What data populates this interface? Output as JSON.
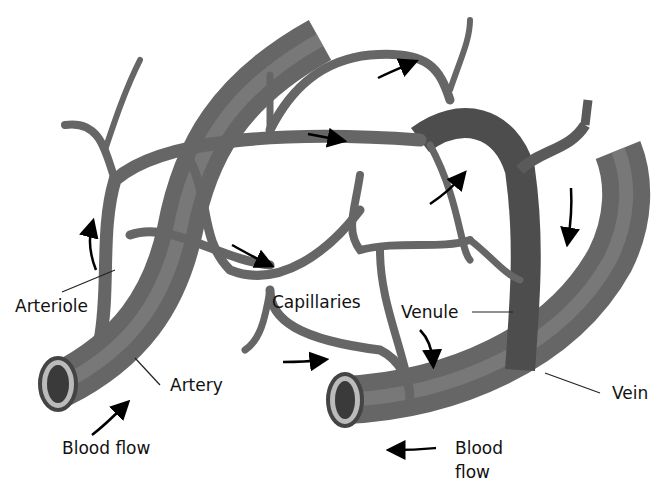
{
  "diagram": {
    "colors": {
      "background": "#ffffff",
      "vessel_dark": "#4a4a4a",
      "vessel_mid": "#7a7a7a",
      "vessel_light": "#a8a8a8",
      "text": "#111111",
      "arrow": "#000000"
    },
    "labels": {
      "arteriole": "Arteriole",
      "artery": "Artery",
      "blood_flow_left": "Blood flow",
      "capillaries": "Capillaries",
      "venule": "Venule",
      "vein": "Vein",
      "blood_flow_right_line1": "Blood",
      "blood_flow_right_line2": "flow"
    },
    "arrows": [
      {
        "id": "arrow-flow-in",
        "direction": "up-right"
      },
      {
        "id": "arrow-arteriole-up",
        "direction": "up"
      },
      {
        "id": "arrow-top-right",
        "direction": "right"
      },
      {
        "id": "arrow-mid-right",
        "direction": "right"
      },
      {
        "id": "arrow-capillary-right",
        "direction": "down-right"
      },
      {
        "id": "arrow-capillary-up",
        "direction": "up-right"
      },
      {
        "id": "arrow-vein-down",
        "direction": "down"
      },
      {
        "id": "arrow-bottom-right",
        "direction": "right"
      },
      {
        "id": "arrow-venule-down",
        "direction": "down"
      },
      {
        "id": "arrow-flow-out",
        "direction": "left"
      }
    ]
  }
}
